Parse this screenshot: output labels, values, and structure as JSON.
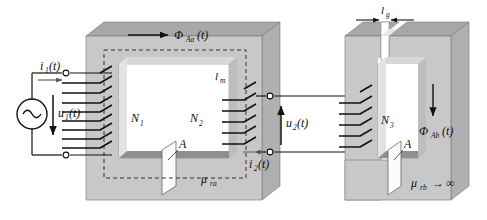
{
  "figure": {
    "type": "electrical-magnetic-circuit-diagram"
  },
  "colors": {
    "core_front": "#c8c8c8",
    "core_top": "#a8a8a8",
    "core_side": "#b4b4b4",
    "core_inner_shadow": "#8f8f8f",
    "window": "#ffffff",
    "line": "#111111",
    "area_patch": "#fbfbfb",
    "background": "#ffffff"
  },
  "labels": {
    "current_primary": {
      "base": "i",
      "sub": "1",
      "arg": "(t)"
    },
    "voltage_primary": {
      "base": "u",
      "sub": "1",
      "arg": "(t)"
    },
    "turns_primary": {
      "base": "N",
      "sub": "1"
    },
    "turns_secondary": {
      "base": "N",
      "sub": "2"
    },
    "turns_tertiary": {
      "base": "N",
      "sub": "3"
    },
    "voltage_secondary": {
      "base": "u",
      "sub": "2",
      "arg": "(t)"
    },
    "current_secondary": {
      "base": "i",
      "sub": "2",
      "arg": "(t)"
    },
    "flux_core_a": {
      "base": "Φ",
      "sub": "Aa",
      "arg": "(t)"
    },
    "flux_core_b": {
      "base": "Φ",
      "sub": "Ab",
      "arg": "(t)"
    },
    "mean_path_length": {
      "base": "l",
      "sub": "m"
    },
    "gap_length": {
      "base": "l",
      "sub": "g"
    },
    "area_core_a": {
      "base": "A"
    },
    "area_core_b": {
      "base": "A"
    },
    "permeability_a": {
      "base": "μ",
      "sub": "ra"
    },
    "permeability_b": {
      "base": "μ",
      "sub": "rb",
      "arrow": "→",
      "limit": "∞"
    }
  },
  "components": {
    "ac_source": "ac-voltage-source",
    "terminal_marker": "open-circle-terminal",
    "winding_turns_primary": 9,
    "winding_turns_secondary": 6,
    "winding_turns_tertiary": 6,
    "flux_path_style": "dashed",
    "air_gap_present": true
  }
}
